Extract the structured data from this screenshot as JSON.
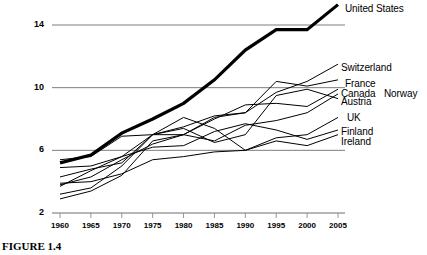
{
  "figure": {
    "caption": "FIGURE 1.4",
    "width": 427,
    "height": 255
  },
  "chart_data": {
    "type": "line",
    "title": "",
    "subtitle": "",
    "xlabel": "",
    "ylabel": "",
    "xlim": [
      1960,
      2005
    ],
    "ylim": [
      2,
      16
    ],
    "grid": true,
    "grid_axis": "y",
    "legend_position": "right-inline-labels",
    "x_ticks": [
      1960,
      1965,
      1970,
      1975,
      1980,
      1985,
      1990,
      1995,
      2000,
      2005
    ],
    "x_tick_labels": [
      "1960",
      "1965",
      "1970",
      "1975",
      "1980",
      "1985",
      "1990",
      "1995",
      "2000",
      "2005"
    ],
    "y_ticks": [
      2,
      6,
      10,
      14
    ],
    "y_tick_labels": [
      "2",
      "6",
      "10",
      "14"
    ],
    "x": [
      1960,
      1965,
      1970,
      1975,
      1980,
      1985,
      1990,
      1995,
      2000,
      2005
    ],
    "series": [
      {
        "name": "United States",
        "emphasis": true,
        "color": "#000000",
        "linewidth": 3.2,
        "values": [
          5.2,
          5.7,
          7.1,
          8.0,
          9.0,
          10.5,
          12.4,
          13.7,
          13.7,
          15.3
        ],
        "label_y_value": 15.6
      },
      {
        "name": "Switzerland",
        "emphasis": false,
        "color": "#000000",
        "linewidth": 1,
        "values": [
          4.9,
          5.0,
          5.6,
          7.0,
          7.5,
          8.2,
          8.4,
          9.7,
          10.4,
          11.5
        ],
        "label_y_value": 11.5
      },
      {
        "name": "France",
        "emphasis": false,
        "color": "#000000",
        "linewidth": 1,
        "values": [
          3.8,
          4.3,
          5.4,
          6.4,
          7.0,
          8.1,
          8.4,
          10.4,
          10.1,
          10.5
        ],
        "label_y_value": 10.5
      },
      {
        "name": "Canada",
        "emphasis": false,
        "color": "#000000",
        "linewidth": 1,
        "values": [
          5.4,
          5.6,
          6.9,
          7.0,
          7.0,
          8.0,
          8.9,
          9.0,
          8.8,
          9.9
        ],
        "label_y_value": 9.9
      },
      {
        "name": "Norway",
        "emphasis": false,
        "color": "#000000",
        "linewidth": 1,
        "values": [
          2.9,
          3.4,
          4.4,
          6.6,
          7.0,
          6.6,
          7.6,
          7.9,
          8.4,
          9.6
        ],
        "label_y_value": 9.6
      },
      {
        "name": "Austria",
        "emphasis": false,
        "color": "#000000",
        "linewidth": 1,
        "values": [
          4.3,
          4.8,
          5.2,
          7.0,
          7.4,
          6.5,
          7.0,
          9.5,
          9.9,
          9.3
        ],
        "label_y_value": 9.3
      },
      {
        "name": "UK",
        "emphasis": false,
        "color": "#000000",
        "linewidth": 1,
        "values": [
          3.9,
          4.0,
          4.5,
          5.4,
          5.6,
          5.9,
          6.0,
          6.8,
          7.0,
          8.1
        ],
        "label_y_value": 8.1
      },
      {
        "name": "Finland",
        "emphasis": false,
        "color": "#000000",
        "linewidth": 1,
        "values": [
          3.7,
          4.7,
          5.6,
          6.2,
          6.3,
          7.2,
          7.7,
          7.3,
          6.7,
          7.3
        ],
        "label_y_value": 7.3
      },
      {
        "name": "Ireland",
        "emphasis": false,
        "color": "#000000",
        "linewidth": 1,
        "values": [
          3.2,
          3.6,
          5.0,
          7.0,
          8.1,
          7.4,
          6.0,
          6.6,
          6.3,
          7.0
        ],
        "label_y_value": 7.0
      }
    ],
    "inline_labels": [
      {
        "text": "United States",
        "x": 345,
        "y": 3
      },
      {
        "text": "Switzerland",
        "x": 341,
        "y": 62
      },
      {
        "text": "France",
        "x": 345,
        "y": 78
      },
      {
        "text": "Canada",
        "x": 341,
        "y": 88
      },
      {
        "text": "Norway",
        "x": 384,
        "y": 88
      },
      {
        "text": "Austria",
        "x": 341,
        "y": 96
      },
      {
        "text": "UK",
        "x": 347,
        "y": 112
      },
      {
        "text": "Finland",
        "x": 341,
        "y": 126
      },
      {
        "text": "Ireland",
        "x": 341,
        "y": 136
      }
    ]
  }
}
